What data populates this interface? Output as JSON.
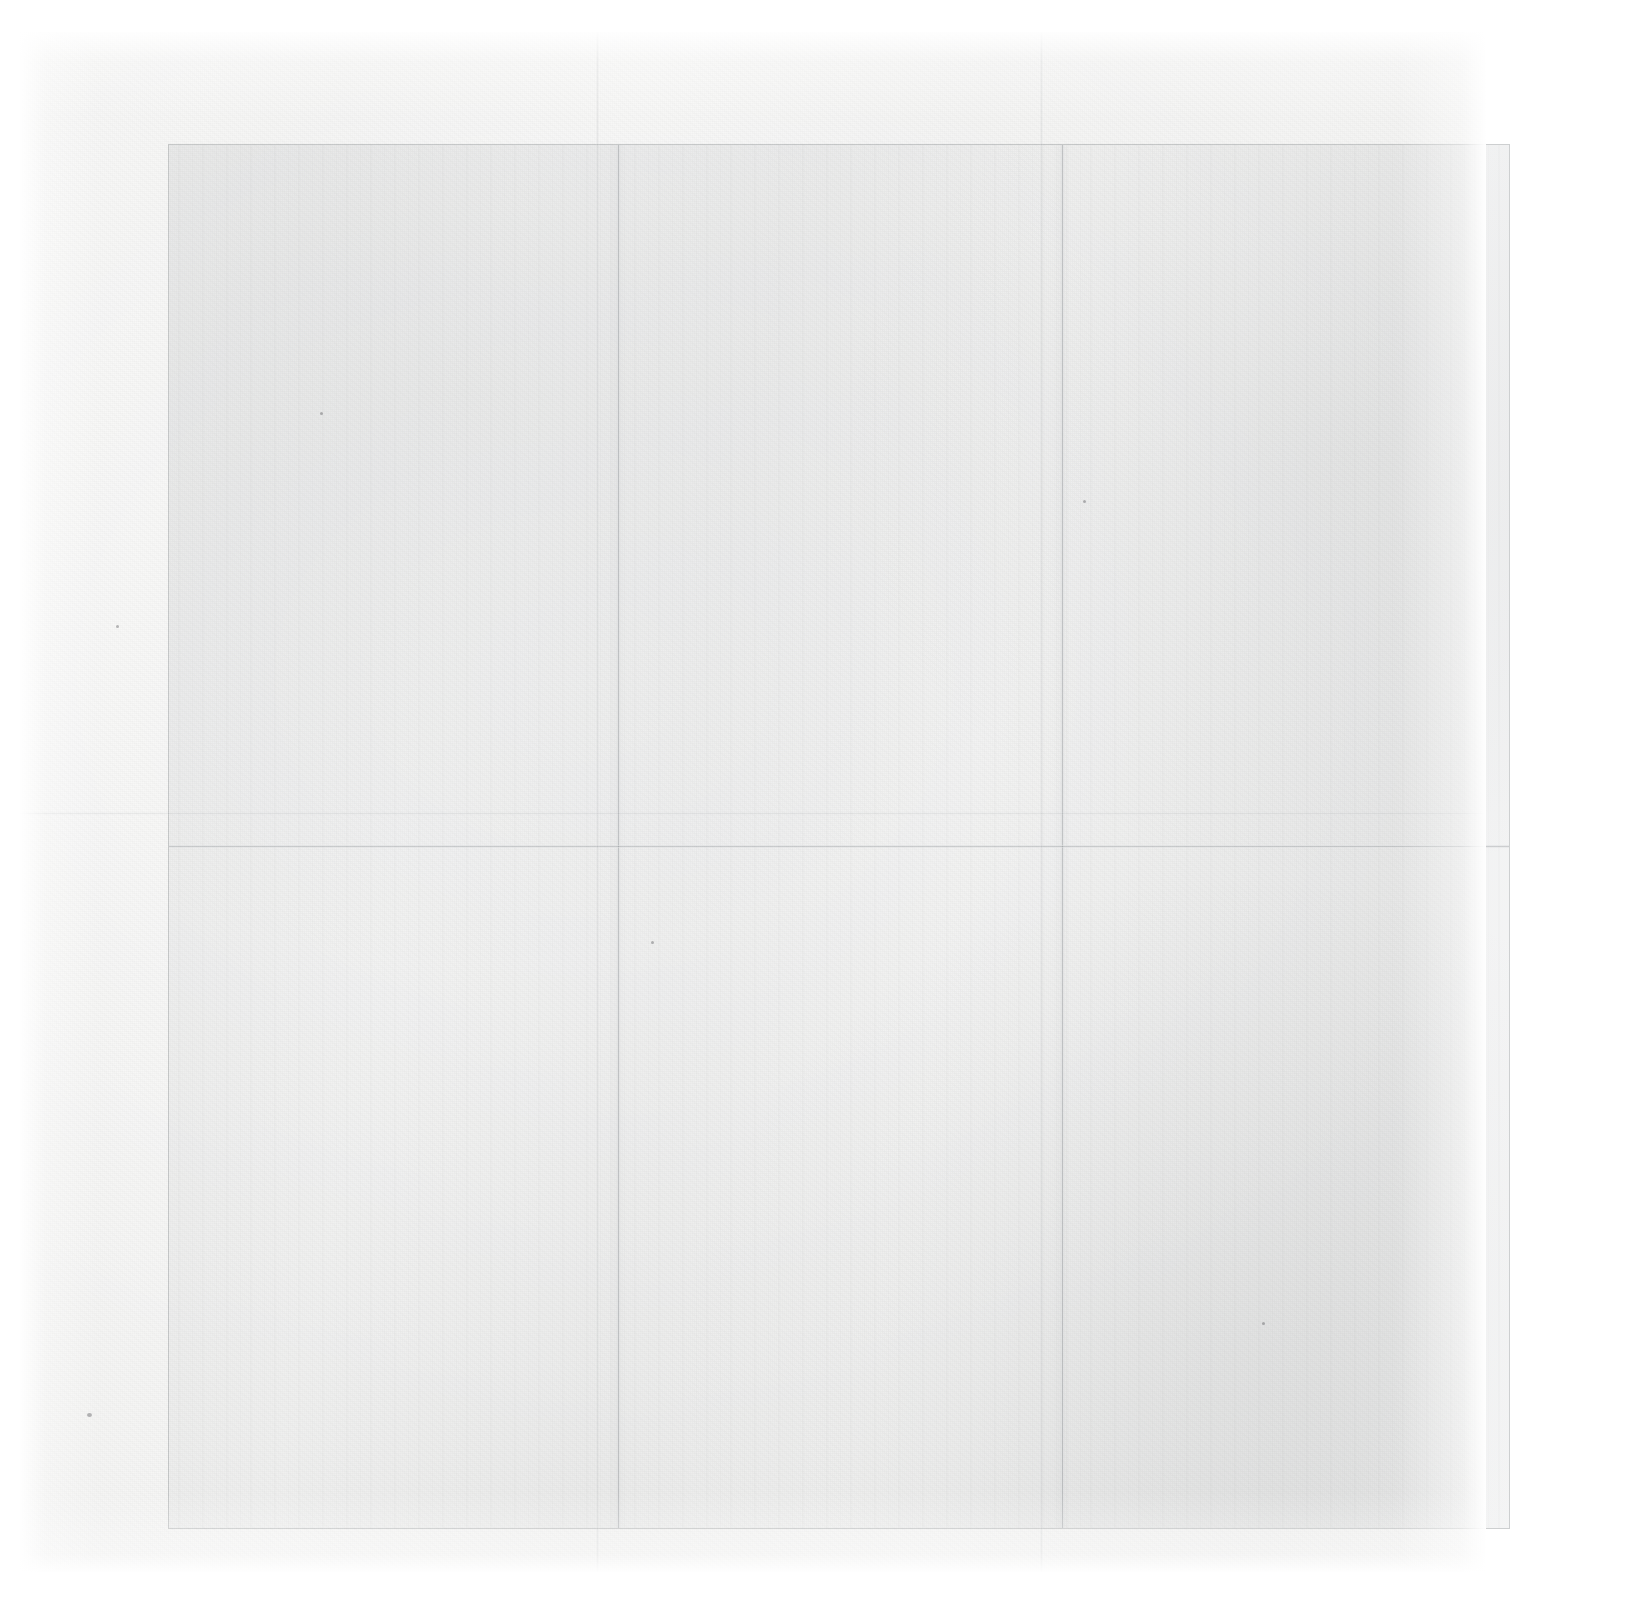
{
  "document": {
    "kind": "scanned-page",
    "caption": "",
    "visible_text": [],
    "page_background_color": "#ffffff"
  },
  "paper": {
    "sheet_color": "#f3f3f2",
    "sheet_highlight_color": "#f6f6f5",
    "sheet_shadow_color": "#f0f0ef",
    "bounds": {
      "left": 20,
      "top": 32,
      "width": 1466,
      "height": 1540
    }
  },
  "content_area": {
    "border_color": "#5a5f64",
    "tint_color": "#787d82",
    "bounds": {
      "left": 148,
      "top": 112,
      "width": 1342,
      "height": 1385
    }
  },
  "folds": {
    "crease_color": "#787d82",
    "vertical": [
      {
        "name": "fold-vertical-left",
        "x": 448
      },
      {
        "name": "fold-vertical-right",
        "x": 892
      }
    ],
    "horizontal": [
      {
        "name": "fold-horizontal-middle",
        "y": 700
      }
    ]
  },
  "specks": [
    {
      "name": "speck-bottom-left",
      "x": 87,
      "y": 1413,
      "size": 5
    },
    {
      "name": "speck-mid-left",
      "x": 116,
      "y": 625,
      "size": 3
    },
    {
      "name": "speck-upper-left",
      "x": 320,
      "y": 412,
      "size": 3
    },
    {
      "name": "speck-center",
      "x": 1083,
      "y": 500,
      "size": 3
    },
    {
      "name": "speck-lower-center",
      "x": 651,
      "y": 941,
      "size": 3
    },
    {
      "name": "speck-lower-right",
      "x": 1262,
      "y": 1322,
      "size": 3
    }
  ]
}
